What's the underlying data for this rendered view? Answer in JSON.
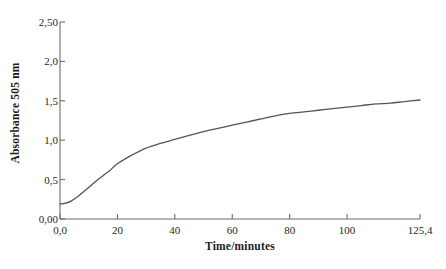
{
  "chart_data": {
    "type": "line",
    "title": "",
    "xlabel": "Time/minutes",
    "ylabel": "Absorbance 505 nm",
    "xlim": [
      0,
      125.4
    ],
    "ylim": [
      0,
      2.5
    ],
    "grid": false,
    "legend": null,
    "xticks": [
      {
        "value": 0,
        "label": "0,0"
      },
      {
        "value": 20,
        "label": "20"
      },
      {
        "value": 40,
        "label": "40"
      },
      {
        "value": 60,
        "label": "60"
      },
      {
        "value": 80,
        "label": "80"
      },
      {
        "value": 100,
        "label": "100"
      },
      {
        "value": 125.4,
        "label": "125,4"
      }
    ],
    "yticks": [
      {
        "value": 0.0,
        "label": "0,00"
      },
      {
        "value": 0.5,
        "label": "0,5"
      },
      {
        "value": 1.0,
        "label": "1,0"
      },
      {
        "value": 1.5,
        "label": "1,5"
      },
      {
        "value": 2.0,
        "label": "2,0"
      },
      {
        "value": 2.5,
        "label": "2,50"
      }
    ],
    "series": [
      {
        "name": "Absorbance",
        "color": "#555555",
        "x": [
          0,
          2,
          4,
          6,
          8,
          10,
          12.5,
          15,
          17.5,
          20,
          25,
          30,
          35,
          40,
          45,
          50,
          55,
          60,
          65,
          70,
          75,
          80,
          85,
          90,
          95,
          100,
          105,
          110,
          115,
          120,
          125.4
        ],
        "y": [
          0.19,
          0.2,
          0.23,
          0.28,
          0.34,
          0.4,
          0.48,
          0.55,
          0.62,
          0.7,
          0.81,
          0.9,
          0.96,
          1.01,
          1.06,
          1.11,
          1.15,
          1.19,
          1.23,
          1.27,
          1.31,
          1.34,
          1.36,
          1.38,
          1.4,
          1.42,
          1.44,
          1.46,
          1.47,
          1.49,
          1.51
        ]
      }
    ]
  },
  "axis_style": {
    "spine_color": "#6b6b6b",
    "tick_color": "#6b6b6b",
    "background": "#ffffff"
  }
}
